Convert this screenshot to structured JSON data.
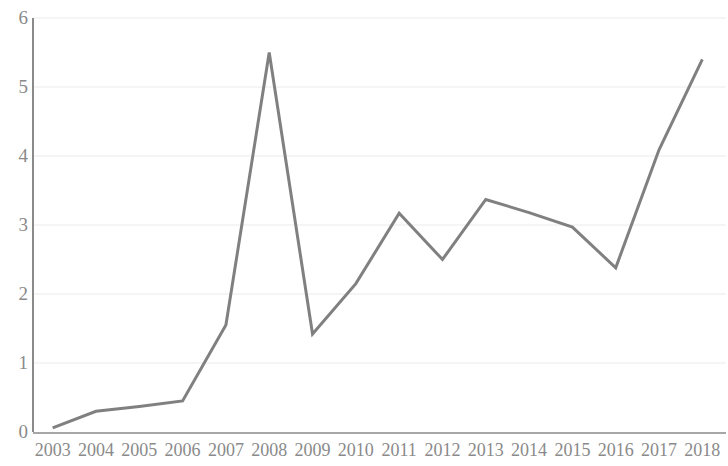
{
  "chart_data": {
    "type": "line",
    "title": "",
    "subtitle": "",
    "xlabel": "",
    "ylabel": "",
    "categories": [
      "2003",
      "2004",
      "2005",
      "2006",
      "2007",
      "2008",
      "2009",
      "2010",
      "2011",
      "2012",
      "2013",
      "2014",
      "2015",
      "2016",
      "2017",
      "2018"
    ],
    "values": [
      0.06,
      0.3,
      0.37,
      0.45,
      1.55,
      5.5,
      1.42,
      2.15,
      3.17,
      2.5,
      3.37,
      3.18,
      2.97,
      2.38,
      4.09,
      5.4
    ],
    "series": [
      {
        "name": "",
        "values": [
          0.06,
          0.3,
          0.37,
          0.45,
          1.55,
          5.5,
          1.42,
          2.15,
          3.17,
          2.5,
          3.37,
          3.18,
          2.97,
          2.38,
          4.09,
          5.4
        ]
      }
    ],
    "ylim": [
      0,
      6
    ],
    "yticks": [
      0,
      1,
      2,
      3,
      4,
      5,
      6
    ],
    "ytick_labels": [
      "0",
      "1",
      "2",
      "3",
      "4",
      "5",
      "6"
    ],
    "xtick_labels": [
      "2003",
      "2004",
      "2005",
      "2006",
      "2007",
      "2008",
      "2009",
      "2010",
      "2011",
      "2012",
      "2013",
      "2014",
      "2015",
      "2016",
      "2017",
      "2018"
    ],
    "grid": true,
    "grid_axis": "y",
    "legend": false,
    "legend_position": "none",
    "annotations": [],
    "line_color": "#808080",
    "axis_color": "#8a8a8a",
    "grid_color": "#ebebeb",
    "tick_label_color": "#8a8a8a",
    "background_color": "#ffffff"
  }
}
